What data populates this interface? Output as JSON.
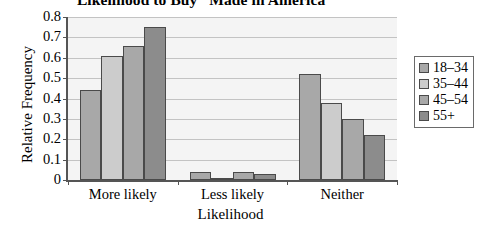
{
  "chart_data": {
    "type": "bar",
    "title": "Likelihood to Buy “Made in America”",
    "xlabel": "Likelihood",
    "ylabel": "Relative Frequency",
    "ylim": [
      0,
      0.8
    ],
    "ytick_labels": [
      "0",
      "0.1",
      "0.2",
      "0.3",
      "0.4",
      "0.5",
      "0.6",
      "0.7",
      "0.8"
    ],
    "ytick_values": [
      0,
      0.1,
      0.2,
      0.3,
      0.4,
      0.5,
      0.6,
      0.7,
      0.8
    ],
    "grid": true,
    "legend_position": "right",
    "categories": [
      "More likely",
      "Less likely",
      "Neither"
    ],
    "series": [
      {
        "name": "18–34",
        "color": "#a8a8a8",
        "values": [
          0.44,
          0.04,
          0.52
        ]
      },
      {
        "name": "35–44",
        "color": "#cccccc",
        "values": [
          0.61,
          0.01,
          0.38
        ]
      },
      {
        "name": "45–54",
        "color": "#a8a8a8",
        "values": [
          0.66,
          0.04,
          0.3
        ]
      },
      {
        "name": "55+",
        "color": "#8c8c8c",
        "values": [
          0.75,
          0.03,
          0.22
        ]
      }
    ]
  }
}
